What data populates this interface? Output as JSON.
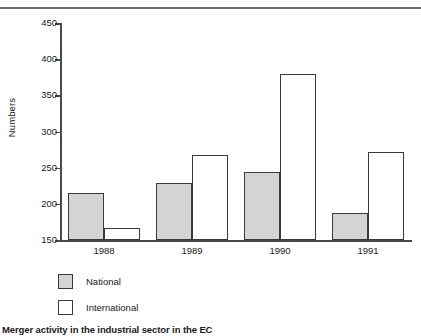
{
  "chart_data": {
    "type": "bar",
    "title": "",
    "caption": "Merger activity in the industrial sector in the EC",
    "xlabel": "",
    "ylabel": "Numbers",
    "categories": [
      "1988",
      "1989",
      "1990",
      "1991"
    ],
    "series": [
      {
        "name": "National",
        "color": "#d4d4d4",
        "values": [
          215,
          229,
          244,
          188
        ]
      },
      {
        "name": "International",
        "color": "#ffffff",
        "values": [
          167,
          267,
          380,
          271
        ]
      }
    ],
    "ylim": [
      150,
      450
    ],
    "yticks": [
      150,
      200,
      250,
      300,
      350,
      400,
      450
    ],
    "ytick_labels": [
      "150",
      "200",
      "250",
      "300",
      "350",
      "400",
      "450"
    ],
    "grid": false,
    "legend_position": "below-left",
    "legend_entries": [
      "National",
      "International"
    ],
    "axis_color": "#4a4a4a",
    "bar_edge_color": "#3a3a3a"
  },
  "figure": {
    "rule_color": "#6b6b6b"
  }
}
